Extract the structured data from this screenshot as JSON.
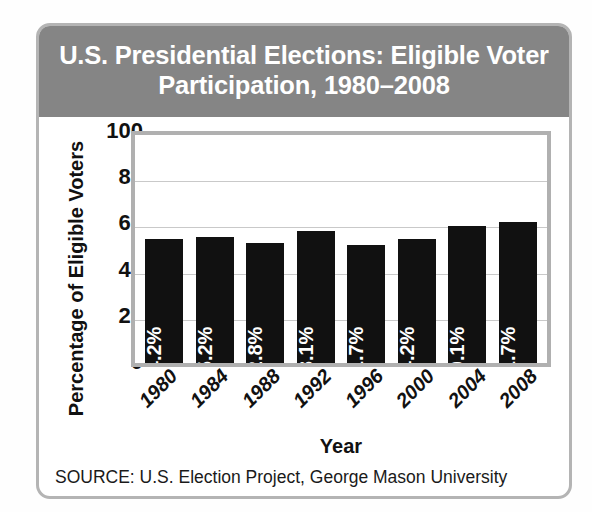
{
  "card": {
    "title": "U.S. Presidential Elections: Eligible Voter Participation, 1980–2008",
    "source_note": "SOURCE: U.S. Election Project, George Mason University",
    "band_color": "#858585",
    "border_color": "#b4b4b4",
    "bar_color": "#111111"
  },
  "chart_data": {
    "type": "bar",
    "title": "U.S. Presidential Elections: Eligible Voter Participation, 1980–2008",
    "xlabel": "Year",
    "ylabel": "Percentage of Eligible Voters",
    "categories": [
      "1980",
      "1984",
      "1988",
      "1992",
      "1996",
      "2000",
      "2004",
      "2008"
    ],
    "values": [
      54.2,
      55.2,
      52.8,
      58.1,
      51.7,
      54.2,
      60.1,
      61.7
    ],
    "value_labels": [
      "54.2%",
      "55.2%",
      "52.8%",
      "58.1%",
      "51.7%",
      "54.2%",
      "60.1%",
      "61.7%"
    ],
    "ylim": [
      0,
      100
    ],
    "yticks": [
      100,
      80,
      60,
      40,
      20,
      0
    ],
    "ytick_labels": [
      "100",
      "80",
      "60",
      "40",
      "20",
      "0"
    ],
    "grid": true,
    "grid_axis": "y",
    "legend": false,
    "legend_position": "none",
    "bar_color": "#111111",
    "value_label_color": "#ffffff",
    "xtick_rotation": -45,
    "source": "SOURCE: U.S. Election Project, George Mason University"
  }
}
